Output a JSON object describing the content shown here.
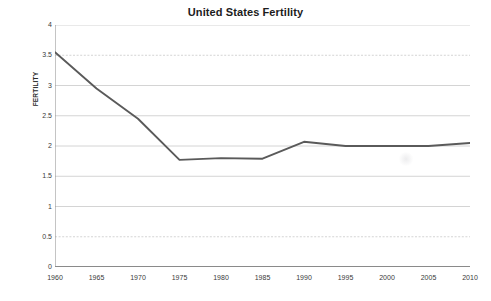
{
  "chart_data": {
    "type": "line",
    "title": "United States Fertility",
    "xlabel": "",
    "ylabel": "FERTILITY",
    "x": [
      1960,
      1965,
      1970,
      1975,
      1980,
      1985,
      1990,
      1995,
      2000,
      2005,
      2010
    ],
    "values": [
      3.55,
      2.95,
      2.45,
      1.77,
      1.8,
      1.79,
      2.07,
      2.0,
      2.0,
      2.0,
      2.05
    ],
    "series": [
      {
        "name": "Fertility",
        "values": [
          3.55,
          2.95,
          2.45,
          1.77,
          1.8,
          1.79,
          2.07,
          2.0,
          2.0,
          2.0,
          2.05
        ]
      }
    ],
    "xlim": [
      1960,
      2010
    ],
    "ylim": [
      0,
      4
    ],
    "x_ticks": [
      "1960",
      "1965",
      "1970",
      "1975",
      "1980",
      "1985",
      "1990",
      "1995",
      "2000",
      "2005",
      "2010"
    ],
    "y_ticks": [
      "0",
      "0.5",
      "1",
      "1.5",
      "2",
      "2.5",
      "3",
      "3.5",
      "4"
    ],
    "y_tick_values": [
      0,
      0.5,
      1,
      1.5,
      2,
      2.5,
      3,
      3.5,
      4
    ],
    "grid": true,
    "grid_axis": "y",
    "legend": false,
    "legend_position": "none",
    "line_color": "#5a5a5a",
    "grid_color": "#c9c9c9",
    "axis_color": "#8a8a8a",
    "background_color": "#ffffff",
    "annotations": []
  }
}
